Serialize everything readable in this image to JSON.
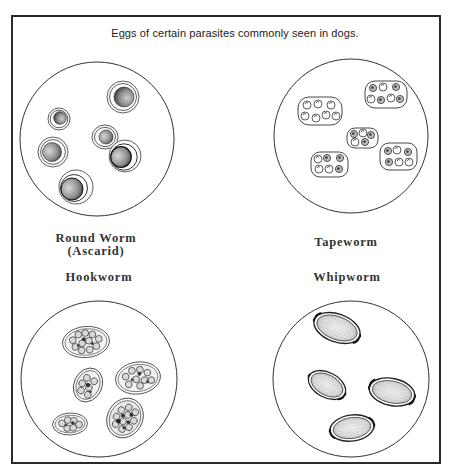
{
  "figure": {
    "title": "Eggs of certain parasites commonly seen in dogs.",
    "panels": [
      {
        "id": "roundworm",
        "label_line1": "Round Worm",
        "label_line2": "(Ascarid)",
        "circle": {
          "cx": 97,
          "cy": 139,
          "r": 77
        },
        "egg_shape": "round, thick concentric shell, dark stippled core",
        "egg_count": 6
      },
      {
        "id": "tapeworm",
        "label_line1": "Tapeworm",
        "circle": {
          "cx": 351,
          "cy": 136,
          "r": 77
        },
        "egg_shape": "rounded-rectangle packets containing multiple round eggs",
        "egg_count": 5
      },
      {
        "id": "hookworm",
        "label_line1": "Hookworm",
        "circle": {
          "cx": 99,
          "cy": 379,
          "r": 78
        },
        "egg_shape": "oval, thin shell, segmented morula inside",
        "egg_count": 5
      },
      {
        "id": "whipworm",
        "label_line1": "Whipworm",
        "circle": {
          "cx": 351,
          "cy": 379,
          "r": 78
        },
        "egg_shape": "lemon/barrel shaped with polar plugs, stippled interior",
        "egg_count": 4
      }
    ]
  },
  "colors": {
    "ink": "#2a2a2a",
    "background": "#ffffff",
    "stipple_dark": "#3a3a3a",
    "stipple_light": "#9a9a9a"
  }
}
